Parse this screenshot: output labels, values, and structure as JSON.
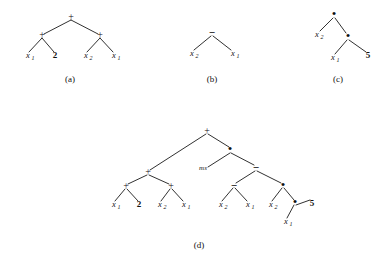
{
  "figure": {
    "background_color": "#ffffff",
    "ink_color": "#111111",
    "width": 389,
    "height": 262
  },
  "panels": [
    {
      "id": "a",
      "caption": "(a)",
      "caption_x": 70,
      "caption_y": 82,
      "expression": "(x1 + 2) + (x2 + x1)",
      "nodes": [
        {
          "name": "root",
          "glyph": "+",
          "kind": "plus",
          "x": 71,
          "y": 18
        },
        {
          "name": "left-op",
          "glyph": "+",
          "kind": "plus",
          "x": 42,
          "y": 36
        },
        {
          "name": "right-op",
          "glyph": "+",
          "kind": "plus",
          "x": 100,
          "y": 36
        }
      ],
      "leaves": [
        {
          "name": "leaf-x1-a",
          "label": "x",
          "sub": "1",
          "kind": "var",
          "x": 28,
          "y": 58
        },
        {
          "name": "leaf-2-a",
          "label": "2",
          "sub": "",
          "kind": "const",
          "x": 55,
          "y": 58
        },
        {
          "name": "leaf-x2-a",
          "label": "x",
          "sub": "2",
          "kind": "var",
          "x": 86,
          "y": 58
        },
        {
          "name": "leaf-x1b-a",
          "label": "x",
          "sub": "1",
          "kind": "var",
          "x": 114,
          "y": 58
        }
      ],
      "edges": [
        [
          71,
          20,
          44,
          34
        ],
        [
          71,
          20,
          98,
          34
        ],
        [
          42,
          38,
          29,
          52
        ],
        [
          42,
          38,
          54,
          52
        ],
        [
          100,
          38,
          87,
          52
        ],
        [
          100,
          38,
          113,
          52
        ]
      ]
    },
    {
      "id": "b",
      "caption": "(b)",
      "caption_x": 212,
      "caption_y": 82,
      "expression": "x2 - x1",
      "nodes": [
        {
          "name": "root",
          "glyph": "−",
          "kind": "minus",
          "x": 212,
          "y": 33
        }
      ],
      "leaves": [
        {
          "name": "leaf-x2-b",
          "label": "x",
          "sub": "2",
          "kind": "var",
          "x": 192,
          "y": 56
        },
        {
          "name": "leaf-x1-b",
          "label": "x",
          "sub": "1",
          "kind": "var",
          "x": 233,
          "y": 56
        }
      ],
      "edges": [
        [
          211,
          36,
          194,
          50
        ],
        [
          213,
          36,
          231,
          50
        ]
      ]
    },
    {
      "id": "c",
      "caption": "(c)",
      "caption_x": 338,
      "caption_y": 82,
      "expression": "x2 * (x1 * 5)",
      "nodes": [
        {
          "name": "root",
          "glyph": "•",
          "kind": "times",
          "x": 334,
          "y": 15
        },
        {
          "name": "right-op",
          "glyph": "•",
          "kind": "times",
          "x": 348,
          "y": 37
        }
      ],
      "leaves": [
        {
          "name": "leaf-x2-c",
          "label": "x",
          "sub": "2",
          "kind": "var",
          "x": 317,
          "y": 37
        },
        {
          "name": "leaf-x1-c",
          "label": "x",
          "sub": "1",
          "kind": "var",
          "x": 333,
          "y": 60
        },
        {
          "name": "leaf-5-c",
          "label": "5",
          "sub": "",
          "kind": "const",
          "x": 368,
          "y": 58
        }
      ],
      "edges": [
        [
          333,
          18,
          320,
          31
        ],
        [
          335,
          18,
          346,
          33
        ],
        [
          347,
          40,
          335,
          54
        ],
        [
          349,
          40,
          366,
          52
        ]
      ]
    },
    {
      "id": "d",
      "caption": "(d)",
      "caption_x": 199,
      "caption_y": 248,
      "expression": "((x1 + 2) + (x2 + x1)) + ((x2 - x1) * (x2 * (x1 * 5)))",
      "annotation": {
        "name": "ms-label",
        "text": "ms",
        "x": 203,
        "y": 170
      },
      "nodes": [
        {
          "name": "root",
          "glyph": "+",
          "kind": "plus",
          "x": 207,
          "y": 132
        },
        {
          "name": "left-plus",
          "glyph": "+",
          "kind": "plus",
          "x": 148,
          "y": 173
        },
        {
          "name": "left-left-plus",
          "glyph": "+",
          "kind": "plus",
          "x": 126,
          "y": 187
        },
        {
          "name": "left-right-plus",
          "glyph": "+",
          "kind": "plus",
          "x": 171,
          "y": 187
        },
        {
          "name": "right-times",
          "glyph": "•",
          "kind": "times",
          "x": 230,
          "y": 150
        },
        {
          "name": "right-minus",
          "glyph": "−",
          "kind": "minus",
          "x": 256,
          "y": 168
        },
        {
          "name": "rm-left-minus",
          "glyph": "−",
          "kind": "minus",
          "x": 234,
          "y": 186
        },
        {
          "name": "rm-right-times",
          "glyph": "•",
          "kind": "times",
          "x": 283,
          "y": 186
        },
        {
          "name": "rm-rr-times",
          "glyph": "•",
          "kind": "times",
          "x": 295,
          "y": 203
        }
      ],
      "leaves": [
        {
          "name": "leaf-x1-d1",
          "label": "x",
          "sub": "1",
          "kind": "var",
          "x": 114,
          "y": 207
        },
        {
          "name": "leaf-2-d",
          "label": "2",
          "sub": "",
          "kind": "const",
          "x": 139,
          "y": 207
        },
        {
          "name": "leaf-x2-d1",
          "label": "x",
          "sub": "2",
          "kind": "var",
          "x": 160,
          "y": 207
        },
        {
          "name": "leaf-x1-d2",
          "label": "x",
          "sub": "1",
          "kind": "var",
          "x": 184,
          "y": 207
        },
        {
          "name": "leaf-x2-d2",
          "label": "x",
          "sub": "2",
          "kind": "var",
          "x": 221,
          "y": 207
        },
        {
          "name": "leaf-x1-d3",
          "label": "x",
          "sub": "1",
          "kind": "var",
          "x": 248,
          "y": 207
        },
        {
          "name": "leaf-x2-d3",
          "label": "x",
          "sub": "2",
          "kind": "var",
          "x": 271,
          "y": 207
        },
        {
          "name": "leaf-x1-d4",
          "label": "x",
          "sub": "1",
          "kind": "var",
          "x": 286,
          "y": 224
        },
        {
          "name": "leaf-5-d",
          "label": "5",
          "sub": "",
          "kind": "const",
          "x": 312,
          "y": 206
        }
      ],
      "edges": [
        [
          206,
          134,
          150,
          170
        ],
        [
          208,
          134,
          229,
          147
        ],
        [
          230,
          153,
          208,
          167
        ],
        [
          231,
          153,
          254,
          165
        ],
        [
          255,
          171,
          236,
          183
        ],
        [
          257,
          171,
          281,
          183
        ],
        [
          147,
          175,
          128,
          184
        ],
        [
          149,
          175,
          169,
          184
        ],
        [
          125,
          189,
          115,
          201
        ],
        [
          127,
          189,
          138,
          201
        ],
        [
          170,
          189,
          161,
          201
        ],
        [
          172,
          189,
          183,
          201
        ],
        [
          233,
          188,
          222,
          201
        ],
        [
          235,
          188,
          247,
          201
        ],
        [
          282,
          188,
          272,
          201
        ],
        [
          284,
          188,
          294,
          200
        ],
        [
          294,
          205,
          287,
          218
        ],
        [
          296,
          205,
          310,
          200
        ]
      ]
    }
  ]
}
